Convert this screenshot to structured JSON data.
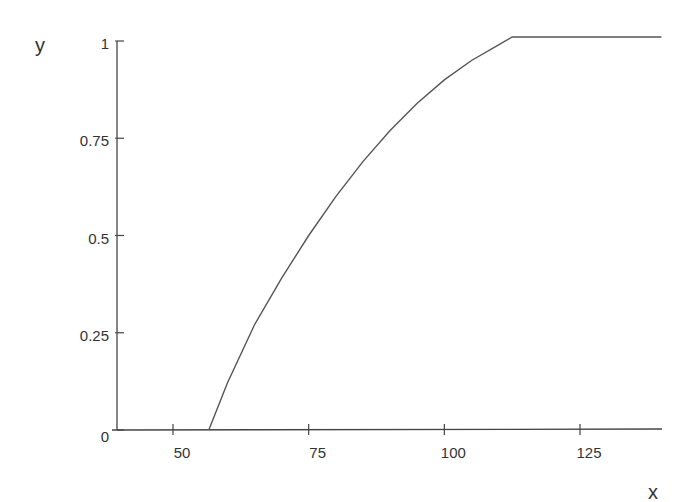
{
  "chart_data": {
    "type": "line",
    "title": "",
    "xlabel": "x",
    "ylabel": "y",
    "xlim": [
      40,
      140
    ],
    "ylim": [
      0,
      1
    ],
    "x_ticks": [
      50,
      75,
      100,
      125
    ],
    "x_tick_labels": [
      "50",
      "75",
      "100",
      "125"
    ],
    "y_ticks": [
      0,
      0.25,
      0.5,
      0.75,
      1
    ],
    "y_tick_labels": [
      "0",
      "0.25",
      "0.5",
      "0.75",
      "1"
    ],
    "grid": false,
    "legend": null,
    "series": [
      {
        "name": "y",
        "color": "#555555",
        "x": [
          40,
          56.6,
          60,
          65,
          70,
          75,
          80,
          85,
          90,
          95,
          100,
          105,
          110,
          112.5,
          120,
          130,
          140
        ],
        "y": [
          0,
          0,
          0.12,
          0.27,
          0.39,
          0.5,
          0.6,
          0.69,
          0.77,
          0.84,
          0.9,
          0.95,
          0.99,
          1,
          1,
          1,
          1
        ]
      }
    ]
  },
  "axes": {
    "x_title": "x",
    "y_title": "y"
  }
}
